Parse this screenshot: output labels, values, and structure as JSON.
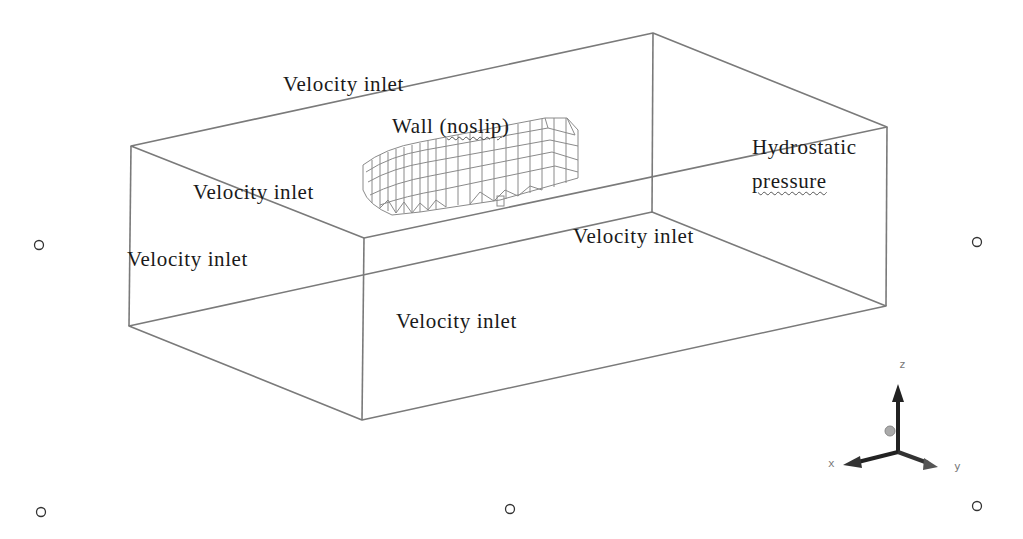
{
  "diagram": {
    "type": "cfd-domain-boundary-conditions",
    "boundaries": [
      {
        "id": "top",
        "label": "Velocity inlet"
      },
      {
        "id": "hull",
        "label_prefix": "Wall (",
        "label_flagged": "noslip",
        "label_suffix": ")"
      },
      {
        "id": "back-left",
        "label": "Velocity inlet"
      },
      {
        "id": "left",
        "label": "Velocity inlet"
      },
      {
        "id": "bottom",
        "label": "Velocity inlet"
      },
      {
        "id": "front",
        "label": "Velocity inlet"
      },
      {
        "id": "outlet",
        "label_line1": "Hydrostatic",
        "label_line2": "pressure"
      }
    ],
    "axes": {
      "x": "x",
      "y": "y",
      "z": "z"
    },
    "colors": {
      "box_edge": "#7a7a7a",
      "hull_mesh": "#8a8a8a",
      "text": "#1a1a1a",
      "triad": "#222222",
      "handle": "#555555"
    },
    "selection_handles": 5
  }
}
